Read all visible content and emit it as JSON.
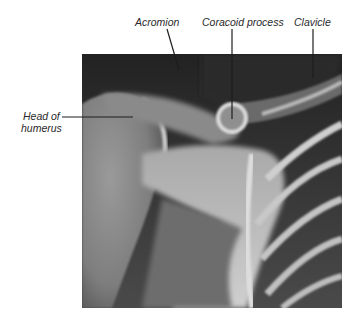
{
  "figure": {
    "type": "annotated chest/shoulder radiograph",
    "labels": {
      "acromion": "Acromion",
      "coracoid": "Coracoid process",
      "clavicle": "Clavicle",
      "humerus_line1": "Head of",
      "humerus_line2": "humerus"
    },
    "colors": {
      "background": "#ffffff",
      "label_text": "#2a2a2a",
      "leader_line": "#1e1e1e",
      "xray_dark": "#2e2e2e",
      "xray_bone": "#d8d8d8"
    }
  }
}
